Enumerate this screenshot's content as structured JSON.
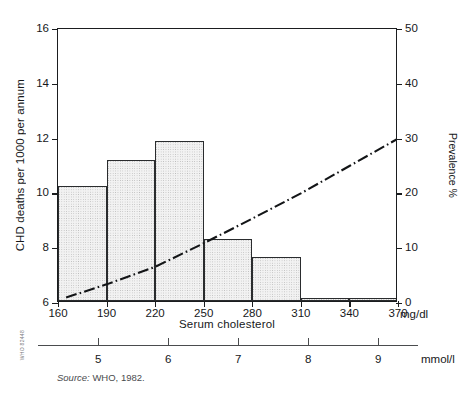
{
  "figure": {
    "source_note_prefix": "Source:",
    "source_note_text": "WHO, 1982.",
    "plate_code": "WHO 82448"
  },
  "axes": {
    "left": {
      "title": "CHD deaths per 1000 per annum",
      "ticks": [
        6,
        8,
        10,
        12,
        14,
        16
      ],
      "min": 6,
      "max": 16
    },
    "right": {
      "title": "Prevalence %",
      "ticks": [
        0,
        10,
        20,
        30,
        40,
        50
      ],
      "min": 0,
      "max": 50
    },
    "bottom": {
      "title": "Serum cholesterol",
      "unit": "mg/dl",
      "ticks": [
        160,
        190,
        220,
        250,
        280,
        310,
        340,
        370
      ],
      "min": 160,
      "max": 370
    },
    "secondary_bottom": {
      "unit": "mmol/l",
      "ticks": [
        5,
        6,
        7,
        8,
        9
      ],
      "min": 4.14,
      "max": 9.57
    }
  },
  "chart_data": {
    "type": "bar",
    "title": "",
    "xlabel": "Serum cholesterol",
    "ylabel": "CHD deaths per 1000 per annum",
    "y2label": "Prevalence %",
    "xlim": [
      160,
      370
    ],
    "ylim": [
      6,
      16
    ],
    "y2lim": [
      0,
      50
    ],
    "grid": false,
    "legend": "none",
    "categories": [
      "160-190",
      "190-220",
      "220-250",
      "250-280",
      "280-310",
      "310-340",
      "340-370"
    ],
    "bin_edges": [
      160,
      190,
      220,
      250,
      280,
      310,
      340,
      370
    ],
    "series": [
      {
        "name": "CHD deaths per 1000 per annum",
        "type": "bar",
        "axis": "left",
        "values": [
          10.2,
          11.15,
          11.85,
          8.25,
          7.6,
          6.1,
          6.1
        ]
      },
      {
        "name": "Prevalence %",
        "type": "line",
        "style": "dash-dot",
        "axis": "right",
        "x": [
          165,
          190,
          220,
          250,
          280,
          310,
          340,
          370
        ],
        "values": [
          1.0,
          3.4,
          6.6,
          10.9,
          15.4,
          20.0,
          25.0,
          30.0
        ]
      }
    ]
  }
}
